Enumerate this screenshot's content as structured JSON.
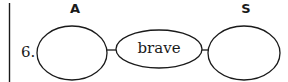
{
  "labels": {
    "col_a": "A",
    "col_s": "S"
  },
  "item": {
    "number": "6.",
    "left_box": "",
    "middle_word": "brave",
    "right_box": ""
  },
  "colors": {
    "stroke": "#1a1a1a",
    "background": "#ffffff"
  }
}
